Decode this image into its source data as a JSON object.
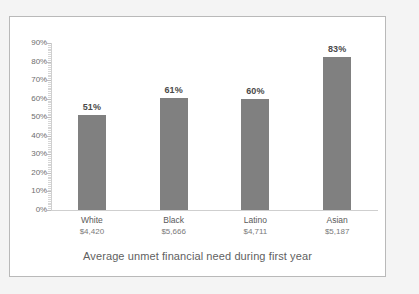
{
  "chart_data": {
    "type": "bar",
    "title": "",
    "caption": "Average unmet financial need during first year",
    "xlabel": "",
    "ylabel": "",
    "ylim": [
      0,
      90
    ],
    "ytick_step": 10,
    "grid": false,
    "legend": "none",
    "bar_color": "#808080",
    "frame_color": "#b9b9b9",
    "axis_color": "#cfcfcf",
    "categories": [
      "White",
      "Black",
      "Latino",
      "Asian"
    ],
    "values": [
      51,
      60.5,
      60,
      82.5
    ],
    "data_labels": [
      "51%",
      "61%",
      "60%",
      "83%"
    ],
    "sublabels": [
      "$4,420",
      "$5,666",
      "$4,711",
      "$5,187"
    ],
    "ytick_labels": [
      "90%",
      "80%",
      "70%",
      "60%",
      "50%",
      "40%",
      "30%",
      "20%",
      "10%",
      "0%"
    ],
    "ytick_values": [
      90,
      80,
      70,
      60,
      50,
      40,
      30,
      20,
      10,
      0
    ]
  }
}
